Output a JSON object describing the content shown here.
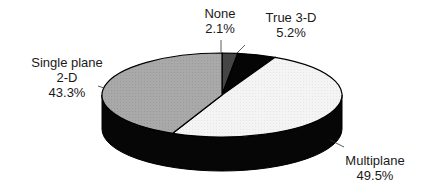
{
  "chart_data": {
    "type": "pie",
    "style": "3d",
    "title": "",
    "categories": [
      "None",
      "True 3-D",
      "Multiplane",
      "Single plane 2-D"
    ],
    "values": [
      2.1,
      5.2,
      49.5,
      43.3
    ],
    "unit": "%",
    "colors": [
      "#444444",
      "#000000",
      "#f2f2f2",
      "#a6a6a6"
    ],
    "legend": "none",
    "labels": [
      {
        "name_line1": "None",
        "name_line2": "",
        "value": "2.1%"
      },
      {
        "name_line1": "True 3-D",
        "name_line2": "",
        "value": "5.2%"
      },
      {
        "name_line1": "Multiplane",
        "name_line2": "",
        "value": "49.5%"
      },
      {
        "name_line1": "Single plane",
        "name_line2": "2-D",
        "value": "43.3%"
      }
    ]
  }
}
